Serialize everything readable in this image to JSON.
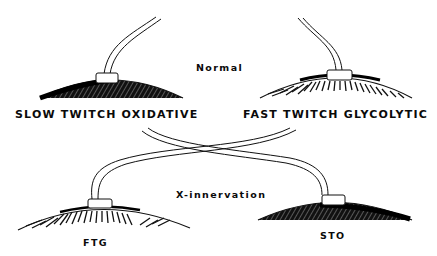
{
  "diagram": {
    "title_normal": "Normal",
    "title_cross": "X-innervation",
    "top_left_muscle": {
      "label": "SLOW TWITCH OXIDATIVE",
      "fill": "dense-crosshatch"
    },
    "top_right_muscle": {
      "label": "FAST TWITCH GLYCOLYTIC",
      "fill": "radial-striations"
    },
    "bottom_left_muscle": {
      "label": "FTG",
      "fill": "radial-striations"
    },
    "bottom_right_muscle": {
      "label": "STO",
      "fill": "dense-crosshatch"
    },
    "colors": {
      "ink": "#0a0a0a",
      "background": "#ffffff"
    }
  }
}
